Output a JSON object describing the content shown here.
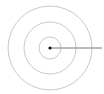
{
  "diagram": {
    "type": "concentric-circles",
    "center": {
      "x": 50,
      "y": 48
    },
    "rings": [
      {
        "name": "outer",
        "radius": 42
      },
      {
        "name": "middle",
        "radius": 26
      },
      {
        "name": "inner",
        "radius": 11
      }
    ],
    "ring_color": "#c8c8c8",
    "center_dot_color": "#111111",
    "pointer_line": {
      "x1": 50,
      "y1": 48,
      "x2": 102,
      "y2": 48,
      "color": "#777777"
    }
  }
}
